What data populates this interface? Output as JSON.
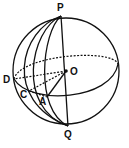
{
  "diagram": {
    "type": "sphere-geometry",
    "labels": {
      "P": "P",
      "Q": "Q",
      "O": "O",
      "D": "D",
      "C": "C",
      "A": "A"
    },
    "points": {
      "P": [
        61,
        16
      ],
      "Q": [
        68,
        126
      ],
      "O": [
        66,
        71
      ],
      "D": [
        14,
        79
      ],
      "C": [
        29,
        91
      ],
      "A": [
        47,
        97
      ]
    },
    "colors": {
      "stroke": "#111111",
      "background": "#ffffff"
    }
  }
}
